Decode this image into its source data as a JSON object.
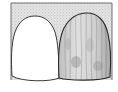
{
  "figure": {
    "background_box": {
      "fill": "#d9d9d9",
      "stroke": "#6e6e6e"
    },
    "teeth": [
      {
        "id": "left",
        "description": "plain white crown",
        "fill": "#ffffff",
        "stroke": "#3a3a3a"
      },
      {
        "id": "right",
        "description": "textured / stained crown with vertical striations",
        "fill": "#cfcfcf",
        "stroke": "#2a2a2a"
      }
    ]
  }
}
